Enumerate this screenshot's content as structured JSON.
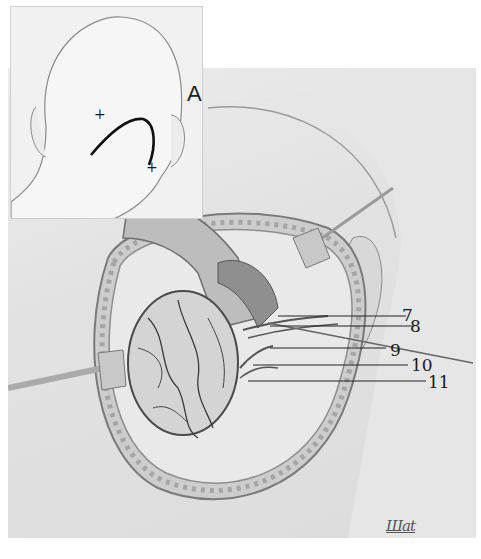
{
  "figure": {
    "inset": {
      "label": "A",
      "markers": [
        "+",
        "+"
      ]
    },
    "callouts": [
      {
        "label": "7",
        "x": 408,
        "y": 318
      },
      {
        "label": "8",
        "x": 417,
        "y": 318
      },
      {
        "label": "9",
        "x": 389,
        "y": 344
      },
      {
        "label": "10",
        "x": 412,
        "y": 358
      },
      {
        "label": "11",
        "x": 428,
        "y": 374
      }
    ],
    "signature": "Шat"
  }
}
